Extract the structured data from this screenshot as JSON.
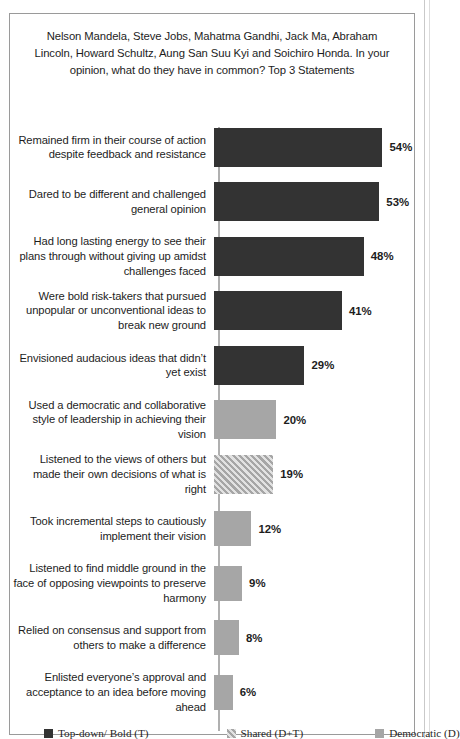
{
  "chart_data": {
    "type": "bar",
    "orientation": "horizontal",
    "title": "Nelson Mandela, Steve Jobs, Mahatma Gandhi, Jack Ma, Abraham Lincoln, Howard Schultz, Aung San Suu Kyi and Soichiro Honda. In your opinion, what do they have in common? Top 3 Statements",
    "xlabel": "",
    "ylabel": "",
    "xlim": [
      0,
      60
    ],
    "grid": false,
    "legend_position": "bottom",
    "value_suffix": "%",
    "categories": [
      "Remained firm in their course of action despite feedback and resistance",
      "Dared to be different and challenged general opinion",
      "Had long lasting energy to see their plans through without giving up amidst challenges faced",
      "Were bold risk-takers that pursued unpopular or unconventional ideas to break new ground",
      "Envisioned audacious  ideas that didn’t yet exist",
      "Used a democratic and collaborative style of leadership  in achieving their vision",
      "Listened to the views of others but made their own decisions of what is right",
      "Took incremental steps to cautiously implement their vision",
      "Listened to find middle ground in the face of opposing viewpoints  to preserve harmony",
      "Relied on consensus and support from others to make a difference",
      "Enlisted everyone’s approval and acceptance to an idea before moving ahead"
    ],
    "values": [
      54,
      53,
      48,
      41,
      29,
      20,
      19,
      12,
      9,
      8,
      6
    ],
    "value_labels": [
      "54%",
      "53%",
      "48%",
      "41%",
      "29%",
      "20%",
      "19%",
      "12%",
      "9%",
      "8%",
      "6%"
    ],
    "series_of_bar": [
      "topdown",
      "topdown",
      "topdown",
      "topdown",
      "topdown",
      "democratic",
      "shared",
      "democratic",
      "democratic",
      "democratic",
      "democratic"
    ],
    "legend": [
      {
        "key": "topdown",
        "label": "Top-down/ Bold (T)",
        "color": "#333333",
        "pattern": "solid"
      },
      {
        "key": "shared",
        "label": "Shared (D+T)",
        "color": "#a6a6a6",
        "pattern": "diagonal-hatch"
      },
      {
        "key": "democratic",
        "label": "Democratic (D)",
        "color": "#a6a6a6",
        "pattern": "solid"
      }
    ]
  }
}
